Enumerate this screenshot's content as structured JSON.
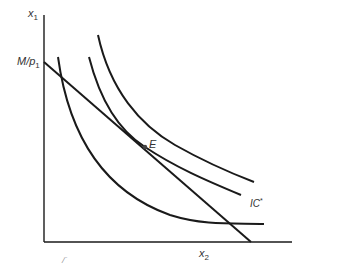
{
  "diagram": {
    "type": "indifference-curve-budget-constraint",
    "y_axis": {
      "label": "x",
      "label_sub": "1"
    },
    "x_axis": {
      "label": "x",
      "label_sub": "2"
    },
    "intercept_label": {
      "main": "M/p",
      "sub": "1"
    },
    "equilibrium_label": "E",
    "curve_label": {
      "main": "IC",
      "sup": "*"
    },
    "stray_mark": "/‾",
    "line_color": "#1a1a1a",
    "curves": [
      {
        "name": "budget-line",
        "kind": "line"
      },
      {
        "name": "indifference-curve-low",
        "kind": "curve"
      },
      {
        "name": "indifference-curve-star",
        "kind": "curve"
      },
      {
        "name": "indifference-curve-high",
        "kind": "curve"
      }
    ]
  }
}
